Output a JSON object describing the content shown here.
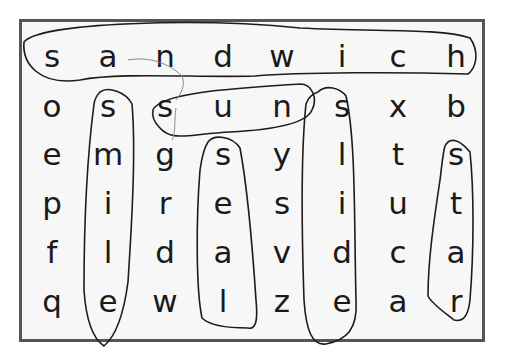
{
  "puzzle": {
    "rows": 6,
    "cols": 8,
    "grid": [
      [
        "s",
        "a",
        "n",
        "d",
        "w",
        "i",
        "c",
        "h"
      ],
      [
        "o",
        "s",
        "s",
        "u",
        "n",
        "s",
        "x",
        "b"
      ],
      [
        "e",
        "m",
        "g",
        "s",
        "y",
        "l",
        "t",
        "s"
      ],
      [
        "p",
        "i",
        "r",
        "e",
        "s",
        "i",
        "u",
        "t"
      ],
      [
        "f",
        "l",
        "d",
        "a",
        "v",
        "d",
        "c",
        "a"
      ],
      [
        "q",
        "e",
        "w",
        "l",
        "z",
        "e",
        "a",
        "r"
      ]
    ],
    "found_words": [
      {
        "word": "sandwich",
        "direction": "horizontal",
        "start": [
          0,
          0
        ],
        "end": [
          0,
          7
        ]
      },
      {
        "word": "sun",
        "direction": "horizontal",
        "start": [
          1,
          2
        ],
        "end": [
          1,
          4
        ]
      },
      {
        "word": "smile",
        "direction": "vertical",
        "start": [
          1,
          1
        ],
        "end": [
          5,
          1
        ]
      },
      {
        "word": "seal",
        "direction": "vertical",
        "start": [
          2,
          3
        ],
        "end": [
          5,
          3
        ]
      },
      {
        "word": "slide",
        "direction": "vertical",
        "start": [
          1,
          5
        ],
        "end": [
          5,
          5
        ]
      },
      {
        "word": "star",
        "direction": "vertical",
        "start": [
          2,
          7
        ],
        "end": [
          5,
          7
        ]
      }
    ]
  },
  "colors": {
    "frame": "#555555",
    "paper": "#f7f7f7",
    "ink": "#1c1c1c"
  }
}
